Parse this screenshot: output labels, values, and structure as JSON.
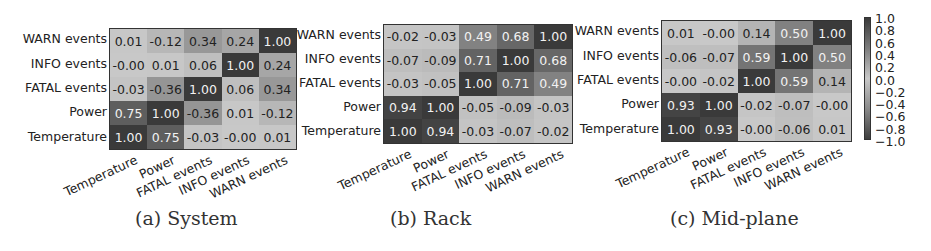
{
  "chart_data": [
    {
      "type": "heatmap",
      "title": "(a) System",
      "x_labels": [
        "Temperature",
        "Power",
        "FATAL events",
        "INFO events",
        "WARN events"
      ],
      "y_labels_top_to_bottom": [
        "WARN events",
        "INFO events",
        "FATAL events",
        "Power",
        "Temperature"
      ],
      "matrix_top_to_bottom": [
        [
          "0.01",
          "-0.12",
          "0.34",
          "0.24",
          "1.00"
        ],
        [
          "-0.00",
          "0.01",
          "0.06",
          "1.00",
          "0.24"
        ],
        [
          "-0.03",
          "-0.36",
          "1.00",
          "0.06",
          "0.34"
        ],
        [
          "0.75",
          "1.00",
          "-0.36",
          "0.01",
          "-0.12"
        ],
        [
          "1.00",
          "0.75",
          "-0.03",
          "-0.00",
          "0.01"
        ]
      ]
    },
    {
      "type": "heatmap",
      "title": "(b) Rack",
      "x_labels": [
        "Temperature",
        "Power",
        "FATAL events",
        "INFO events",
        "WARN events"
      ],
      "y_labels_top_to_bottom": [
        "WARN events",
        "INFO events",
        "FATAL events",
        "Power",
        "Temperature"
      ],
      "matrix_top_to_bottom": [
        [
          "-0.02",
          "-0.03",
          "0.49",
          "0.68",
          "1.00"
        ],
        [
          "-0.07",
          "-0.09",
          "0.71",
          "1.00",
          "0.68"
        ],
        [
          "-0.03",
          "-0.05",
          "1.00",
          "0.71",
          "0.49"
        ],
        [
          "0.94",
          "1.00",
          "-0.05",
          "-0.09",
          "-0.03"
        ],
        [
          "1.00",
          "0.94",
          "-0.03",
          "-0.07",
          "-0.02"
        ]
      ]
    },
    {
      "type": "heatmap",
      "title": "(c) Mid-plane",
      "x_labels": [
        "Temperature",
        "Power",
        "FATAL events",
        "INFO events",
        "WARN events"
      ],
      "y_labels_top_to_bottom": [
        "WARN events",
        "INFO events",
        "FATAL events",
        "Power",
        "Temperature"
      ],
      "matrix_top_to_bottom": [
        [
          "0.01",
          "-0.00",
          "0.14",
          "0.50",
          "1.00"
        ],
        [
          "-0.06",
          "-0.07",
          "0.59",
          "1.00",
          "0.50"
        ],
        [
          "-0.00",
          "-0.02",
          "1.00",
          "0.59",
          "0.14"
        ],
        [
          "0.93",
          "1.00",
          "-0.02",
          "-0.07",
          "-0.00"
        ],
        [
          "1.00",
          "0.93",
          "-0.00",
          "-0.06",
          "0.01"
        ]
      ],
      "colorbar": {
        "ticks": [
          "1.0",
          "0.8",
          "0.6",
          "0.4",
          "0.2",
          "0.0",
          "−0.2",
          "−0.4",
          "−0.6",
          "−0.8",
          "−1.0"
        ],
        "range": [
          -1.0,
          1.0
        ]
      }
    }
  ],
  "colors": {
    "high": "#3a3a3a",
    "mid_high": "#7c7c7c",
    "neutral": "#c8c8c8",
    "text_dark": "#222222",
    "text_light": "#f2f2f2"
  }
}
